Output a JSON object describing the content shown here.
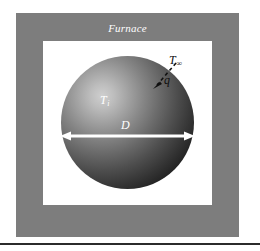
{
  "figure": {
    "type": "thermal-system-schematic",
    "enclosure_label": "Furnace",
    "colors": {
      "enclosure_fill": "#7d7d7d",
      "cavity_fill": "#ffffff",
      "sphere_dark": "#050505",
      "sphere_highlight": "#cfcfcf",
      "label_light": "#ffffff",
      "label_dark": "#101010",
      "rule": "#2b2b2b",
      "page_background": "#ffffff"
    }
  },
  "labels": {
    "surroundings_temperature": {
      "symbol": "T",
      "subscript": "∞"
    },
    "sphere_temperature": {
      "symbol": "T",
      "subscript": "i"
    },
    "diameter": {
      "symbol": "D"
    },
    "heat_rate": {
      "symbol": "q"
    }
  },
  "annotations": {
    "diameter_arrow": {
      "name": "double-headed-arrow",
      "direction": "horizontal",
      "style": "solid",
      "color": "#ffffff",
      "measures": "D"
    },
    "flux_arrow": {
      "name": "dashed-arrow",
      "direction": "toward-sphere",
      "style": "dashed",
      "color": "#101010",
      "measures": "q"
    }
  },
  "footer": {
    "rule": "horizontal-divider"
  }
}
